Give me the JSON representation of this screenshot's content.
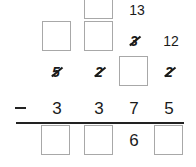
{
  "problem": {
    "type": "column-subtraction-with-borrowing",
    "carry_row_1": {
      "top_box": "",
      "value_13": "13"
    },
    "carry_row_2": {
      "box_1": "",
      "box_2": "",
      "struck_3": "3",
      "value_12": "12"
    },
    "minuend_row": {
      "struck_5": "5",
      "struck_2a": "2",
      "box": "",
      "struck_2b": "2"
    },
    "subtrahend_row": {
      "operator": "−",
      "digits": [
        "3",
        "3",
        "7",
        "5"
      ]
    },
    "result_row": {
      "box_1": "",
      "box_2": "",
      "digit_3": "6",
      "box_4": ""
    }
  },
  "colors": {
    "box_border": "#a8a8a8",
    "text": "#1a1a1a",
    "rule": "#222222"
  }
}
